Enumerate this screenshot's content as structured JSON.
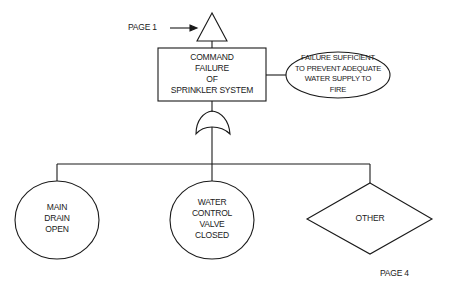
{
  "diagram": {
    "type": "fault-tree",
    "transfer_in": {
      "label": "PAGE 1",
      "symbol": "transfer-triangle"
    },
    "top_event": {
      "lines": [
        "COMMAND",
        "FAILURE",
        "OF",
        "SPRINKLER SYSTEM"
      ]
    },
    "annotation": {
      "lines": [
        "FAILURE SUFFICIENT",
        "TO PREVENT ADEQUATE",
        "WATER SUPPLY TO",
        "FIRE"
      ]
    },
    "gate": {
      "type": "OR"
    },
    "children": [
      {
        "type": "basic-event",
        "shape": "circle",
        "lines": [
          "MAIN",
          "DRAIN",
          "OPEN"
        ]
      },
      {
        "type": "basic-event",
        "shape": "circle",
        "lines": [
          "WATER",
          "CONTROL",
          "VALVE",
          "CLOSED"
        ]
      },
      {
        "type": "undeveloped-event",
        "shape": "diamond",
        "lines": [
          "OTHER"
        ]
      }
    ],
    "page_number": "PAGE 4"
  },
  "colors": {
    "line": "#1a1a1a",
    "background": "#ffffff"
  }
}
